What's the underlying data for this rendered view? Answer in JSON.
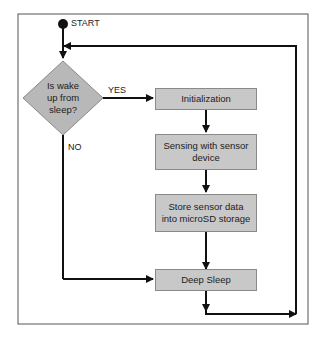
{
  "diagram": {
    "type": "flowchart",
    "start_label": "START",
    "decision": {
      "text": "Is wake up from sleep?",
      "lines": [
        "Is wake",
        "up from",
        "sleep?"
      ]
    },
    "edges": {
      "yes_label": "YES",
      "no_label": "NO"
    },
    "steps": [
      {
        "id": "init",
        "label": "Initialization"
      },
      {
        "id": "sense",
        "label": "Sensing with sensor device"
      },
      {
        "id": "store",
        "label": "Store sensor data into microSD storage"
      },
      {
        "id": "sleep",
        "label": "Deep Sleep"
      }
    ],
    "colors": {
      "box_fill": "#c8c8c8",
      "line": "#111111",
      "frame": "#555555"
    }
  }
}
